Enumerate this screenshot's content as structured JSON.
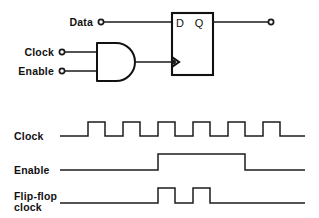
{
  "circuit": {
    "input_labels": {
      "data": "Data",
      "clock": "Clock",
      "enable": "Enable"
    },
    "flipflop": {
      "d_pin": "D",
      "q_pin": "Q"
    },
    "gate": {
      "type": "and-gate"
    },
    "terminals": {
      "data_terminal": "data-input-terminal",
      "clock_terminal": "clock-input-terminal",
      "enable_terminal": "enable-input-terminal",
      "q_terminal": "q-output-terminal"
    }
  },
  "timing": {
    "labels": {
      "clock": "Clock",
      "enable": "Enable",
      "flipflop_clock_line1": "Flip-flop",
      "flipflop_clock_line2": "clock"
    }
  },
  "colors": {
    "ink": "#111111",
    "wire": "#1a1a1a",
    "background": "#ffffff"
  },
  "chart_data": {
    "type": "line",
    "xlabel": "",
    "ylabel": "",
    "grid": false,
    "legend_position": "left",
    "x_range": [
      60,
      310
    ],
    "series": [
      {
        "name": "Clock",
        "low_y": 136,
        "high_y": 122,
        "pulses": [
          {
            "rise": 88,
            "fall": 105
          },
          {
            "rise": 123,
            "fall": 140
          },
          {
            "rise": 158,
            "fall": 175
          },
          {
            "rise": 193,
            "fall": 210
          },
          {
            "rise": 228,
            "fall": 245
          },
          {
            "rise": 263,
            "fall": 280
          }
        ],
        "start_x": 60,
        "end_x": 305,
        "period": 35,
        "duty_cycle": 0.486,
        "pulse_count": 6
      },
      {
        "name": "Enable",
        "low_y": 170,
        "high_y": 154,
        "pulses": [
          {
            "rise": 158,
            "fall": 245
          }
        ],
        "start_x": 60,
        "end_x": 305,
        "pulse_count": 1
      },
      {
        "name": "Flip-flop clock",
        "low_y": 203,
        "high_y": 188,
        "pulses": [
          {
            "rise": 158,
            "fall": 175
          },
          {
            "rise": 193,
            "fall": 210
          }
        ],
        "start_x": 60,
        "end_x": 305,
        "pulse_count": 2
      }
    ]
  }
}
